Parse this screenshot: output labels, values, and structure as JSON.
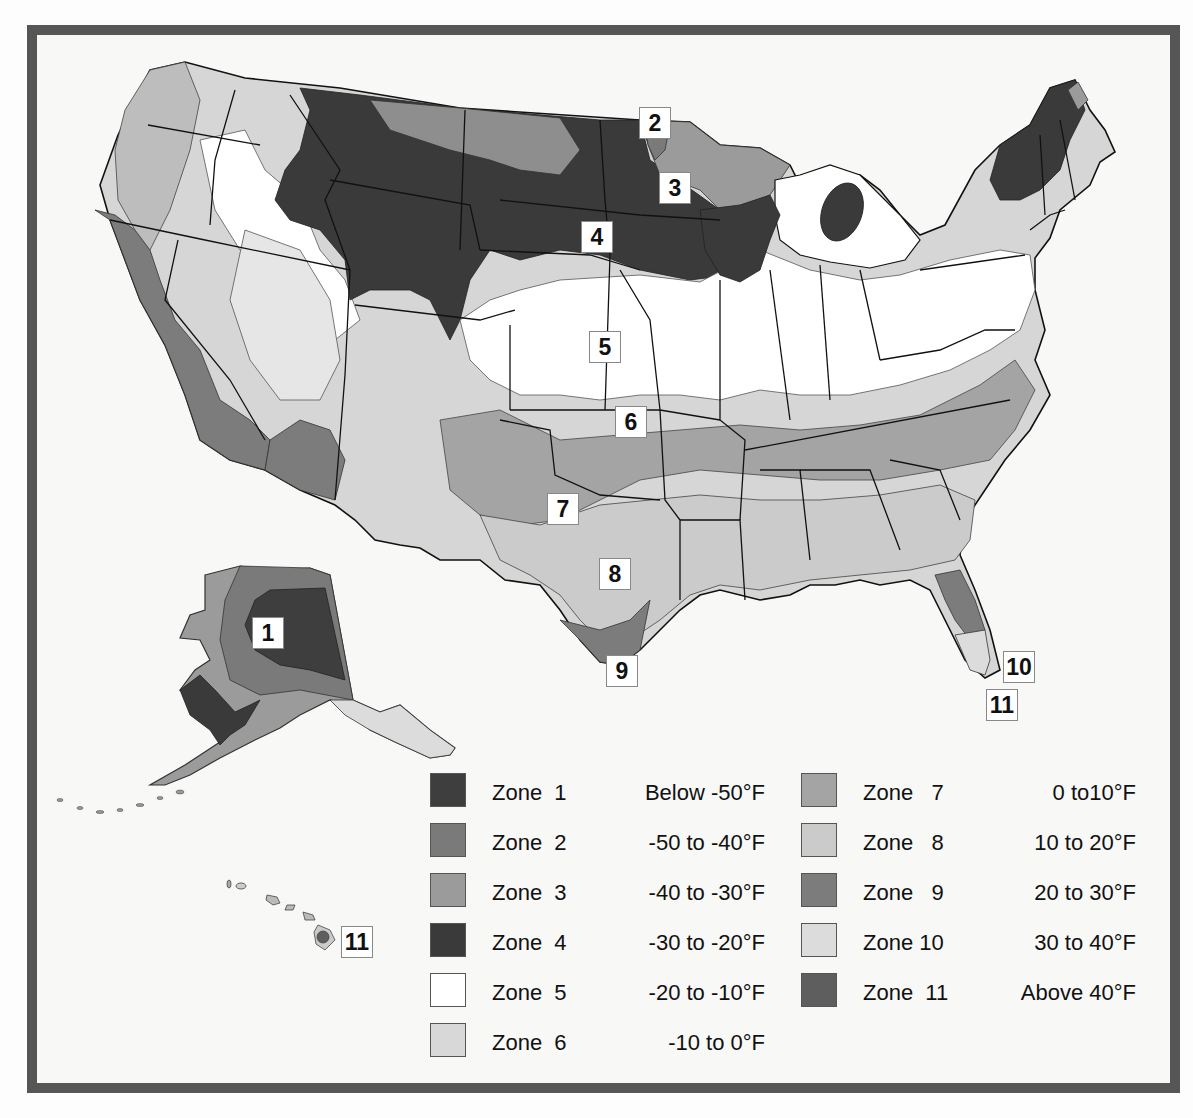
{
  "map": {
    "title": "USDA Plant Hardiness Zone Map",
    "zone_labels": [
      {
        "id": "1",
        "text": "1",
        "x": 268,
        "y": 616
      },
      {
        "id": "2",
        "text": "2",
        "x": 639,
        "y": 107
      },
      {
        "id": "3",
        "text": "3",
        "x": 659,
        "y": 172
      },
      {
        "id": "4",
        "text": "4",
        "x": 581,
        "y": 221
      },
      {
        "id": "5",
        "text": "5",
        "x": 589,
        "y": 331
      },
      {
        "id": "6",
        "text": "6",
        "x": 615,
        "y": 406
      },
      {
        "id": "7",
        "text": "7",
        "x": 547,
        "y": 493
      },
      {
        "id": "8",
        "text": "8",
        "x": 599,
        "y": 558
      },
      {
        "id": "9",
        "text": "9",
        "x": 606,
        "y": 655
      },
      {
        "id": "10",
        "text": "10",
        "x": 1003,
        "y": 651
      },
      {
        "id": "11-florida",
        "text": "11",
        "x": 986,
        "y": 689
      },
      {
        "id": "11-hawaii",
        "text": "11",
        "x": 341,
        "y": 934
      }
    ]
  },
  "legend": {
    "left_column": [
      {
        "zone": "Zone  1",
        "range": "Below -50°F",
        "color": "#3e3e3e"
      },
      {
        "zone": "Zone  2",
        "range": "-50 to -40°F",
        "color": "#7a7a7a"
      },
      {
        "zone": "Zone  3",
        "range": "-40 to -30°F",
        "color": "#9b9b9b"
      },
      {
        "zone": "Zone  4",
        "range": "-30 to -20°F",
        "color": "#3a3a3a"
      },
      {
        "zone": "Zone  5",
        "range": "-20 to -10°F",
        "color": "#ffffff"
      },
      {
        "zone": "Zone  6",
        "range": "-10 to 0°F",
        "color": "#d8d8d8"
      }
    ],
    "right_column": [
      {
        "zone": "Zone   7",
        "range": "0 to10°F",
        "color": "#a4a4a4"
      },
      {
        "zone": "Zone   8",
        "range": "10 to 20°F",
        "color": "#cbcbcb"
      },
      {
        "zone": "Zone   9",
        "range": "20 to 30°F",
        "color": "#7c7c7c"
      },
      {
        "zone": "Zone 10",
        "range": "30 to 40°F",
        "color": "#dcdcdc"
      },
      {
        "zone": "Zone  11",
        "range": "Above 40°F",
        "color": "#5e5e5e"
      }
    ]
  },
  "colors": {
    "frame": "#565656",
    "background": "#f8f8f7",
    "state_line": "#111111"
  }
}
